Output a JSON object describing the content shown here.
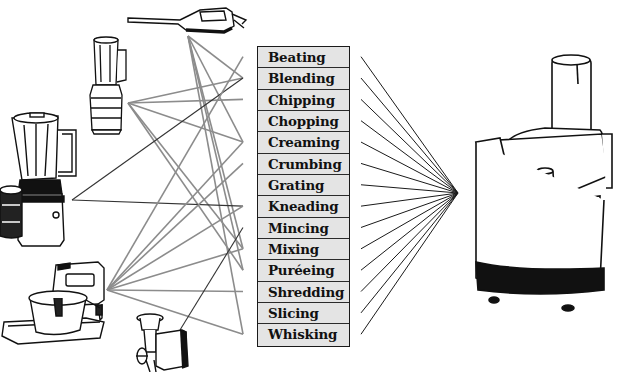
{
  "diagram": {
    "title": "",
    "tasks": [
      {
        "label": "Beating"
      },
      {
        "label": "Blending"
      },
      {
        "label": "Chipping"
      },
      {
        "label": "Chopping"
      },
      {
        "label": "Creaming"
      },
      {
        "label": "Crumbing"
      },
      {
        "label": "Grating"
      },
      {
        "label": "Kneading"
      },
      {
        "label": "Mincing"
      },
      {
        "label": "Mixing"
      },
      {
        "label": "Puréeing"
      },
      {
        "label": "Shredding"
      },
      {
        "label": "Slicing"
      },
      {
        "label": "Whisking"
      }
    ],
    "left_appliances": [
      {
        "name": "hand-blender",
        "anchor": [
          188,
          36
        ],
        "connects_to": [
          "Blending",
          "Creaming",
          "Mixing",
          "Puréeing",
          "Whisking"
        ]
      },
      {
        "name": "small-blender",
        "anchor": [
          128,
          103
        ],
        "connects_to": [
          "Blending",
          "Chipping",
          "Creaming",
          "Puréeing",
          "Mixing"
        ]
      },
      {
        "name": "jug-blender-with-grinder",
        "anchor": [
          72,
          200
        ],
        "connects_to": [
          "Blending",
          "Kneading"
        ]
      },
      {
        "name": "stand-mixer",
        "anchor": [
          107,
          290
        ],
        "connects_to": [
          "Beating",
          "Creaming",
          "Kneading",
          "Mixing",
          "Whisking",
          "Crumbing",
          "Shredding"
        ]
      },
      {
        "name": "mincer",
        "anchor": [
          180,
          330
        ],
        "connects_to": [
          "Mincing"
        ]
      }
    ],
    "right_appliance": {
      "name": "food-processor",
      "anchor": [
        458,
        193
      ],
      "connects_to": "all"
    },
    "colors": {
      "row_fill": "#e4e4e4",
      "border": "#1a1a1a",
      "gray_line": "#8c8c8c",
      "dark_line": "#333333",
      "fan_line": "#1a1a1a"
    }
  }
}
